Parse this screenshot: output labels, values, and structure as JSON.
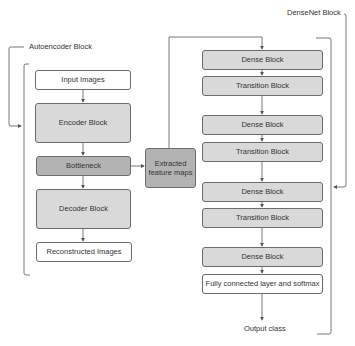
{
  "autoencoder": {
    "title": "Autoencoder Block",
    "blocks": [
      {
        "label": "Input Images",
        "style": "white"
      },
      {
        "label": "Encoder Block",
        "style": "light"
      },
      {
        "label": "Bottleneck",
        "style": "dark"
      },
      {
        "label": "Decoder Block",
        "style": "light"
      },
      {
        "label": "Reconstructed Images",
        "style": "white"
      }
    ]
  },
  "bridge": {
    "label": "Extracted feature maps"
  },
  "densenet": {
    "title": "DenseNet Block",
    "blocks": [
      {
        "label": "Dense Block",
        "style": "light"
      },
      {
        "label": "Transition Block",
        "style": "light"
      },
      {
        "label": "Dense Block",
        "style": "light"
      },
      {
        "label": "Transition Block",
        "style": "light"
      },
      {
        "label": "Dense Block",
        "style": "light"
      },
      {
        "label": "Transition Block",
        "style": "light"
      },
      {
        "label": "Dense Block",
        "style": "light"
      },
      {
        "label": "Fully connected layer and softmax",
        "style": "white"
      }
    ],
    "output": "Output class"
  },
  "colors": {
    "line": "#555555",
    "box_border": "#6b6b6b",
    "light_fill": "#d9d9d9",
    "dark_fill": "#b3b3b3",
    "white_fill": "#ffffff"
  }
}
